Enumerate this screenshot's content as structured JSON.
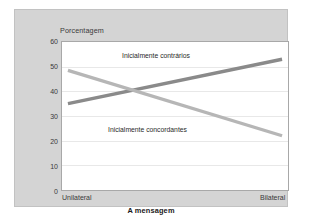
{
  "chart_data": {
    "type": "line",
    "title": "",
    "xlabel": "A mensagem",
    "ylabel": "Porcentagem",
    "categories": [
      "Unilateral",
      "Bilateral"
    ],
    "x_tick_labels": [
      "Unilateral",
      "Bilateral"
    ],
    "y_tick_labels": [
      "0",
      "10",
      "20",
      "30",
      "40",
      "50",
      "60"
    ],
    "y_ticks": [
      0,
      10,
      20,
      30,
      40,
      50,
      60
    ],
    "ylim": [
      0,
      60
    ],
    "grid": true,
    "legend_position": "inline-annotations",
    "series": [
      {
        "name": "Inicialmente contrários",
        "values": [
          35,
          53
        ],
        "color": "#8a8a8a"
      },
      {
        "name": "Inicialmente concordantes",
        "values": [
          48.5,
          22
        ],
        "color": "#b6b6b6"
      }
    ],
    "annotations": [
      {
        "text": "Inicialmente contrários",
        "series": "Inicialmente contrários"
      },
      {
        "text": "Inicialmente concordantes",
        "series": "Inicialmente concordantes"
      }
    ]
  },
  "axes": {
    "y_title": "Porcentagem",
    "x_title": "A mensagem",
    "y_ticks": [
      "60",
      "50",
      "40",
      "30",
      "20",
      "10",
      "0"
    ],
    "x_tick_left": "Unilateral",
    "x_tick_right": "Bilateral"
  },
  "labels": {
    "contrarios": "Inicialmente contrários",
    "concordantes": "Inicialmente concordantes"
  },
  "colors": {
    "frame_background": "#d4d4d4",
    "plot_background": "#ffffff",
    "gridline": "#e8e8e8",
    "series_dark": "#8a8a8a",
    "series_light": "#b6b6b6",
    "text": "#3a3a3a"
  }
}
